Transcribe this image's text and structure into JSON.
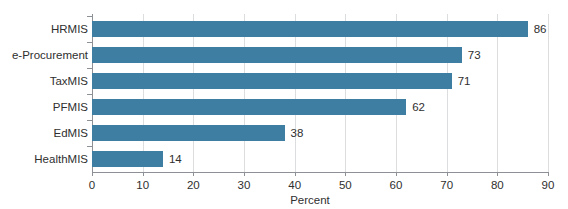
{
  "chart_data": {
    "type": "bar",
    "orientation": "horizontal",
    "title": "",
    "title_remnant": "............",
    "xlabel": "Percent",
    "ylabel": "",
    "categories": [
      "HRMIS",
      "e-Procurement",
      "TaxMIS",
      "PFMIS",
      "EdMIS",
      "HealthMIS"
    ],
    "values": [
      86,
      73,
      71,
      62,
      38,
      14
    ],
    "value_labels": [
      "86",
      "73",
      "71",
      "62",
      "38",
      "14"
    ],
    "xlim": [
      0,
      90
    ],
    "xticks": [
      0,
      10,
      20,
      30,
      40,
      50,
      60,
      70,
      80,
      90
    ],
    "xtick_labels": [
      "0",
      "10",
      "20",
      "30",
      "40",
      "50",
      "60",
      "70",
      "80",
      "90"
    ],
    "grid": "vertical",
    "legend": "none",
    "series": [
      {
        "name": "Percent",
        "values": [
          86,
          73,
          71,
          62,
          38,
          14
        ],
        "color": "#3E7EA3"
      }
    ],
    "colors": {
      "bar": "#3E7EA3",
      "grid": "#DCDDDF",
      "axis": "#8D9196",
      "text": "#2F2F2F",
      "background": "#FFFFFF"
    }
  }
}
